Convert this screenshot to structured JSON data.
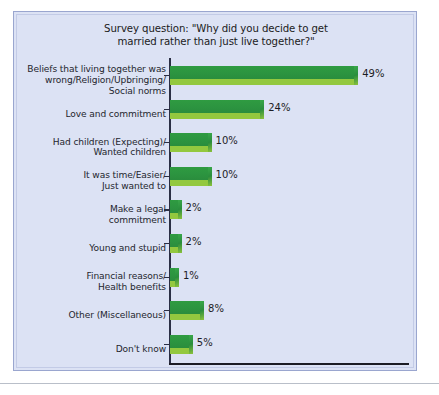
{
  "chart_data": {
    "type": "bar",
    "orientation": "horizontal",
    "title": "Survey question: \"Why did you decide to get married rather than just live together?\"",
    "title_lines": [
      "Survey question: \"Why did you decide to get",
      "married rather than just live together?\""
    ],
    "xlabel": "",
    "ylabel": "",
    "xlim": [
      0,
      49
    ],
    "grid": false,
    "legend": "none",
    "value_suffix": "%",
    "colors": {
      "bar_top": "#2c9440",
      "bar_front": "#93c83f",
      "panel_background": "#dce2f4",
      "panel_border": "#9aa6cf",
      "axis": "#1c1c24",
      "text": "#24262e"
    },
    "categories": [
      "Beliefs that living together was wrong/Religion/Upbringing/Social norms",
      "Love and commitment",
      "Had children (Expecting)/Wanted children",
      "It was time/Easier/Just wanted to",
      "Make a legal commitment",
      "Young and stupid",
      "Financial reasons/Health benefits",
      "Other (Miscellaneous)",
      "Don't know"
    ],
    "values": [
      49,
      24,
      10,
      10,
      2,
      2,
      1,
      8,
      5
    ],
    "value_labels": [
      "49%",
      "24%",
      "10%",
      "10%",
      "2%",
      "2%",
      "1%",
      "8%",
      "5%"
    ],
    "bars": [
      {
        "label_lines": [
          "Beliefs that living together was",
          "wrong/Religion/Upbringing/",
          "Social norms"
        ],
        "value": 49,
        "value_label": "49%"
      },
      {
        "label_lines": [
          "Love and commitment"
        ],
        "value": 24,
        "value_label": "24%"
      },
      {
        "label_lines": [
          "Had children (Expecting)/",
          "Wanted children"
        ],
        "value": 10,
        "value_label": "10%"
      },
      {
        "label_lines": [
          "It was time/Easier/",
          "Just wanted to"
        ],
        "value": 10,
        "value_label": "10%"
      },
      {
        "label_lines": [
          "Make a legal",
          "commitment"
        ],
        "value": 2,
        "value_label": "2%"
      },
      {
        "label_lines": [
          "Young and stupid"
        ],
        "value": 2,
        "value_label": "2%"
      },
      {
        "label_lines": [
          "Financial reasons/",
          "Health benefits"
        ],
        "value": 1,
        "value_label": "1%"
      },
      {
        "label_lines": [
          "Other (Miscellaneous)"
        ],
        "value": 8,
        "value_label": "8%"
      },
      {
        "label_lines": [
          "Don't know"
        ],
        "value": 5,
        "value_label": "5%"
      }
    ]
  }
}
